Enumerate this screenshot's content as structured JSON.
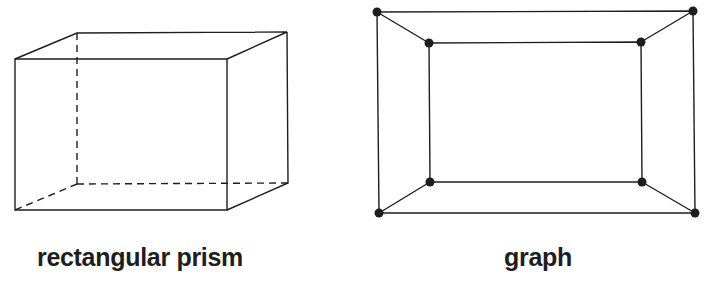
{
  "figures": [
    {
      "id": "rectangular-prism",
      "label": "rectangular prism",
      "front_face": [
        [
          15,
          59
        ],
        [
          227,
          59
        ],
        [
          227,
          210
        ],
        [
          15,
          210
        ]
      ],
      "back_face": [
        [
          77,
          33
        ],
        [
          287,
          32
        ],
        [
          288,
          183
        ],
        [
          77,
          184
        ]
      ],
      "hidden_edges": [
        "back-left-vertical",
        "back-bottom",
        "bottom-left-depth"
      ]
    },
    {
      "id": "graph",
      "label": "graph",
      "outer_vertices": [
        [
          377,
          12
        ],
        [
          693,
          11
        ],
        [
          695,
          213
        ],
        [
          379,
          213
        ]
      ],
      "inner_vertices": [
        [
          429,
          43
        ],
        [
          641,
          42
        ],
        [
          642,
          182
        ],
        [
          430,
          182
        ]
      ],
      "vertex_count": 8,
      "edge_count": 12
    }
  ],
  "colors": {
    "stroke": "#1e1e1e",
    "background": "#ffffff"
  }
}
